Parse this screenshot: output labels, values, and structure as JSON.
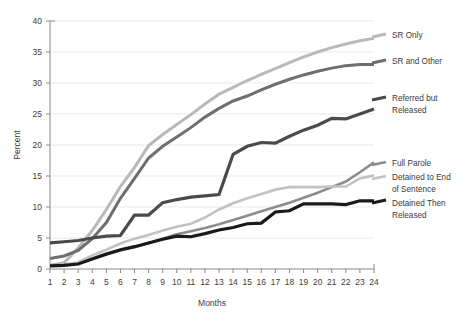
{
  "chart_data": {
    "type": "line",
    "title": "",
    "xlabel": "Months",
    "ylabel": "Percent",
    "xlim": [
      1,
      24
    ],
    "ylim": [
      0,
      40
    ],
    "ytick_step": 5,
    "grid": true,
    "legend_position": "right",
    "x": [
      1,
      2,
      3,
      4,
      5,
      6,
      7,
      8,
      9,
      10,
      11,
      12,
      13,
      14,
      15,
      16,
      17,
      18,
      19,
      20,
      21,
      22,
      23,
      24
    ],
    "xticklabels": [
      "1",
      "2",
      "3",
      "4",
      "5",
      "6",
      "7",
      "8",
      "9",
      "10",
      "11",
      "12",
      "13",
      "14",
      "15",
      "16",
      "17",
      "18",
      "19",
      "20",
      "21",
      "22",
      "23",
      "24"
    ],
    "yticklabels": [
      "0",
      "5",
      "10",
      "15",
      "20",
      "25",
      "30",
      "35",
      "40"
    ],
    "series": [
      {
        "name": "SR Only",
        "color": "#b9b9b9",
        "width": 3.0,
        "label_x": 392,
        "label_y": 37,
        "values": [
          0.6,
          1.0,
          3.4,
          6.2,
          9.6,
          13.3,
          16.4,
          19.9,
          21.7,
          23.3,
          24.9,
          26.6,
          28.2,
          29.3,
          30.4,
          31.4,
          32.3,
          33.3,
          34.2,
          35.0,
          35.7,
          36.3,
          36.8,
          37.2
        ]
      },
      {
        "name": "SR and Other",
        "color": "#6e6e6e",
        "width": 3.0,
        "label_x": 392,
        "label_y": 63,
        "values": [
          1.7,
          2.1,
          3.0,
          4.9,
          7.5,
          11.4,
          14.6,
          17.9,
          19.8,
          21.3,
          22.8,
          24.5,
          25.9,
          27.1,
          27.9,
          28.9,
          29.8,
          30.6,
          31.3,
          31.9,
          32.4,
          32.8,
          33.0,
          33.0
        ]
      },
      {
        "name": "Referred but Released",
        "color": "#4a4a4a",
        "width": 3.2,
        "label_x": 392,
        "label_y": 100,
        "values": [
          4.2,
          4.4,
          4.6,
          5.0,
          5.3,
          5.4,
          8.7,
          8.7,
          10.7,
          11.2,
          11.6,
          11.8,
          12.0,
          18.5,
          19.8,
          20.4,
          20.3,
          21.4,
          22.4,
          23.2,
          24.3,
          24.2,
          25.0,
          25.8
        ]
      },
      {
        "name": "Full Parole",
        "color": "#8c8c8c",
        "width": 2.6,
        "label_x": 392,
        "label_y": 165,
        "values": [
          0.6,
          0.7,
          0.9,
          1.7,
          2.4,
          3.0,
          3.5,
          4.2,
          4.9,
          5.6,
          6.1,
          6.6,
          7.2,
          7.9,
          8.6,
          9.3,
          10.0,
          10.7,
          11.5,
          12.3,
          13.2,
          14.1,
          15.6,
          17.2
        ]
      },
      {
        "name": "Detained to End of Sentence",
        "color": "#c2c2c2",
        "width": 2.6,
        "label_x": 392,
        "label_y": 179,
        "values": [
          0.5,
          0.7,
          1.1,
          2.2,
          3.1,
          4.1,
          4.9,
          5.5,
          6.2,
          6.8,
          7.3,
          8.3,
          9.6,
          10.6,
          11.4,
          12.1,
          12.8,
          13.2,
          13.2,
          13.2,
          13.3,
          13.3,
          14.6,
          15.1
        ]
      },
      {
        "name": "Detained Then Released",
        "color": "#1a1a1a",
        "width": 3.2,
        "label_x": 392,
        "label_y": 203,
        "values": [
          0.5,
          0.6,
          0.8,
          1.6,
          2.4,
          3.1,
          3.6,
          4.2,
          4.8,
          5.3,
          5.2,
          5.7,
          6.3,
          6.7,
          7.3,
          7.4,
          9.2,
          9.4,
          10.5,
          10.5,
          10.5,
          10.4,
          11.0,
          11.0
        ]
      }
    ]
  },
  "legend": {
    "entries": [
      {
        "label": "SR Only"
      },
      {
        "label": "SR and Other"
      },
      {
        "label": "Referred but"
      },
      {
        "label": "Released"
      },
      {
        "label": "Full Parole"
      },
      {
        "label": "Detained to End"
      },
      {
        "label": "of Sentence"
      },
      {
        "label": "Detained Then"
      },
      {
        "label": "Released"
      }
    ]
  },
  "axes": {
    "x_title": "Months",
    "y_title": "Percent"
  }
}
